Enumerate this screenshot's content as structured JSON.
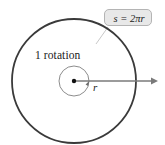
{
  "figure": {
    "background_color": "#ffffff",
    "width": 165,
    "height": 145
  },
  "labels": {
    "rotation": "1 rotation",
    "radius": "r",
    "arc_length_formula": "s = 2πr"
  },
  "colors": {
    "outer_circle_stroke": "#3a3a3a",
    "inner_circle_stroke": "#6e6e6e",
    "radius_arrow": "#7a7a7a",
    "center_dot": "#111111",
    "callout_fill": "#e8e8e8",
    "callout_border": "#b4b4b4",
    "leader_line": "#c2c2c2",
    "text": "#1a1a1a"
  },
  "geometry": {
    "center_x": 74,
    "center_y": 81,
    "outer_radius": 62,
    "inner_radius": 15,
    "radius_arrow_tip_x": 157,
    "outer_stroke_width": 1.8,
    "inner_stroke_width": 0.8,
    "radius_arrow_width": 1.6
  }
}
